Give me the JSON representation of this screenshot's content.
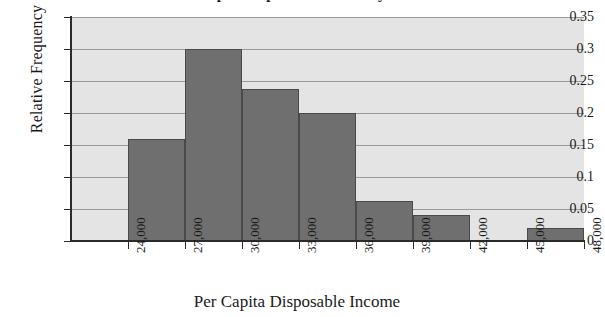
{
  "chart_data": {
    "type": "bar",
    "title": "Per Capita Disposable Income by State",
    "xlabel": "Per Capita Disposable Income",
    "ylabel": "Relative Frequency",
    "grid": true,
    "legend": false,
    "xlim": [
      21000,
      48000
    ],
    "ylim": [
      0,
      0.35
    ],
    "bin_width": 3000,
    "x_tick_labels": [
      "24,000",
      "27,000",
      "30,000",
      "33,000",
      "36,000",
      "39,000",
      "42,000",
      "45,000",
      "48,000"
    ],
    "x_tick_values": [
      24000,
      27000,
      30000,
      33000,
      36000,
      39000,
      42000,
      45000,
      48000
    ],
    "y_tick_labels": [
      "0.35",
      "0.3",
      "0.25",
      "0.2",
      "0.15",
      "0.1",
      "0.05",
      "0"
    ],
    "y_tick_values": [
      0.35,
      0.3,
      0.25,
      0.2,
      0.15,
      0.1,
      0.05,
      0
    ],
    "categories": [
      "24,000-27,000",
      "27,000-30,000",
      "30,000-33,000",
      "33,000-36,000",
      "36,000-39,000",
      "39,000-42,000",
      "42,000-45,000",
      "45,000-48,000"
    ],
    "bins": [
      {
        "start": 24000,
        "end": 27000,
        "label": "24,000-27,000",
        "value": 0.16
      },
      {
        "start": 27000,
        "end": 30000,
        "label": "27,000-30,000",
        "value": 0.3
      },
      {
        "start": 30000,
        "end": 33000,
        "label": "30,000-33,000",
        "value": 0.2375
      },
      {
        "start": 33000,
        "end": 36000,
        "label": "33,000-36,000",
        "value": 0.2
      },
      {
        "start": 36000,
        "end": 39000,
        "label": "36,000-39,000",
        "value": 0.0625
      },
      {
        "start": 39000,
        "end": 42000,
        "label": "39,000-42,000",
        "value": 0.04
      },
      {
        "start": 42000,
        "end": 45000,
        "label": "42,000-45,000",
        "value": 0.0
      },
      {
        "start": 45000,
        "end": 48000,
        "label": "45,000-48,000",
        "value": 0.02
      }
    ],
    "values": [
      0.16,
      0.3,
      0.2375,
      0.2,
      0.0625,
      0.04,
      0.0,
      0.02
    ],
    "colors": {
      "bar_fill": "#6f6f6f",
      "bar_edge": "#4a4a4a",
      "plot_background": "#e4e4e4",
      "gridline": "#9a9a9a",
      "axis": "#2b2b2b",
      "text": "#1a1a1a",
      "figure_background": "#ffffff"
    }
  }
}
